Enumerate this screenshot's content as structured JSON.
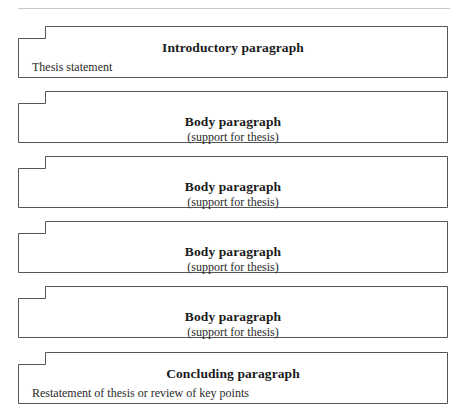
{
  "page": {
    "width": 464,
    "height": 413,
    "background_color": "#ffffff",
    "top_rule_color": "#c9c9c9",
    "border_color": "#555555",
    "text_color": "#1b1b1b"
  },
  "diagram": {
    "name": "essay-structure-outline",
    "boxes": [
      {
        "kind": "intro",
        "title": "Introductory paragraph",
        "subtitle": "Thesis statement",
        "subtitle_align": "left",
        "top": 26,
        "height": 52
      },
      {
        "kind": "body",
        "title": "Body paragraph",
        "subtitle": "(support for thesis)",
        "subtitle_align": "center",
        "top": 91,
        "height": 52
      },
      {
        "kind": "body",
        "title": "Body paragraph",
        "subtitle": "(support for thesis)",
        "subtitle_align": "center",
        "top": 156,
        "height": 52
      },
      {
        "kind": "body",
        "title": "Body paragraph",
        "subtitle": "(support for thesis)",
        "subtitle_align": "center",
        "top": 221,
        "height": 52
      },
      {
        "kind": "body",
        "title": "Body paragraph",
        "subtitle": "(support for thesis)",
        "subtitle_align": "center",
        "top": 286,
        "height": 52
      },
      {
        "kind": "concl",
        "title": "Concluding paragraph",
        "subtitle": "Restatement of thesis or review of key points",
        "subtitle_align": "left",
        "top": 352,
        "height": 52
      }
    ]
  }
}
